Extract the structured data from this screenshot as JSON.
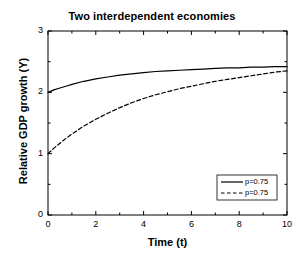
{
  "chart_data": {
    "type": "line",
    "title": "Two interdependent economies",
    "xlabel": "Time (t)",
    "ylabel": "Relative GDP growth (Y)",
    "xlim": [
      0,
      10
    ],
    "ylim": [
      0,
      3
    ],
    "xticks": [
      "0",
      "2",
      "4",
      "6",
      "8",
      "10"
    ],
    "xtick_values": [
      0,
      2,
      4,
      6,
      8,
      10
    ],
    "yticks": [
      "0",
      "1",
      "2",
      "3"
    ],
    "ytick_values": [
      0,
      1,
      2,
      3
    ],
    "minor_ticks": true,
    "grid": false,
    "legend_position": "lower right",
    "x": [
      0,
      0.25,
      0.5,
      0.75,
      1,
      1.5,
      2,
      2.5,
      3,
      3.5,
      4,
      4.5,
      5,
      5.5,
      6,
      6.5,
      7,
      7.5,
      8,
      8.5,
      9,
      9.5,
      10
    ],
    "series": [
      {
        "name": "p=0.75",
        "style": "solid",
        "color": "#000000",
        "values": [
          2.0,
          2.04,
          2.07,
          2.1,
          2.13,
          2.18,
          2.22,
          2.25,
          2.28,
          2.3,
          2.32,
          2.34,
          2.35,
          2.36,
          2.37,
          2.38,
          2.39,
          2.4,
          2.4,
          2.41,
          2.41,
          2.42,
          2.42
        ]
      },
      {
        "name": "p=0.75",
        "style": "dashed",
        "color": "#000000",
        "values": [
          1.0,
          1.09,
          1.17,
          1.25,
          1.32,
          1.45,
          1.56,
          1.66,
          1.75,
          1.83,
          1.9,
          1.96,
          2.01,
          2.06,
          2.1,
          2.14,
          2.18,
          2.21,
          2.24,
          2.27,
          2.3,
          2.33,
          2.35
        ]
      }
    ],
    "legend": [
      {
        "label": "p=0.75",
        "style": "solid"
      },
      {
        "label": "p=0.75",
        "style": "dashed"
      }
    ]
  }
}
